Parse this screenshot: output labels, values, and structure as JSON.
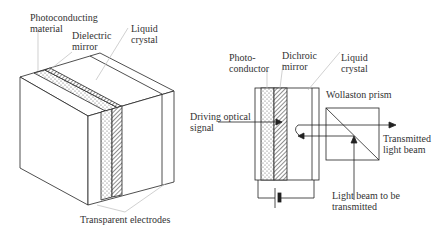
{
  "left_figure": {
    "labels": {
      "photoconducting": "Photoconducting\nmaterial",
      "dielectric_mirror": "Dielectric\nmirror",
      "liquid_crystal": "Liquid\ncrystal",
      "transparent_electrodes": "Transparent electrodes"
    }
  },
  "right_figure": {
    "labels": {
      "photoconductor": "Photo-\nconductor",
      "dichroic_mirror": "Dichroic\nmirror",
      "liquid_crystal": "Liquid\ncrystal",
      "wollaston_prism": "Wollaston prism",
      "driving_signal": "Driving optical\nsignal",
      "transmitted_beam": "Transmitted\nlight beam",
      "beam_to_transmit": "Light beam to be\ntransmitted"
    }
  },
  "colors": {
    "line": "#222222",
    "leader": "#bbbbbb"
  }
}
